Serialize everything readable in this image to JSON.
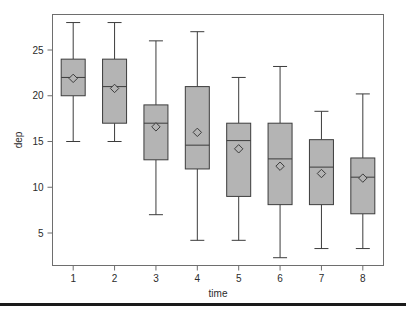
{
  "figure": {
    "background_color": "#ffffff",
    "frame_color": "#6e6e6e",
    "box_fill_color": "#b4b4b4",
    "box_line_color": "#3c3c3c",
    "whisker_color": "#3c3c3c",
    "footer_rule_color": "#1a1a1a"
  },
  "chart_data": {
    "type": "box",
    "title": "",
    "subtitle": "",
    "xlabel": "time",
    "ylabel": "dep",
    "xlim": [
      0.5,
      8.5
    ],
    "ylim": [
      1.2,
      28.6
    ],
    "grid": false,
    "legend": null,
    "categories": [
      "1",
      "2",
      "3",
      "4",
      "5",
      "6",
      "7",
      "8"
    ],
    "xticks": [
      "1",
      "2",
      "3",
      "4",
      "5",
      "6",
      "7",
      "8"
    ],
    "yticks": [
      5,
      10,
      15,
      20,
      25
    ],
    "ytick_labels": [
      "5",
      "10",
      "15",
      "20",
      "25"
    ],
    "mean_marker": "diamond",
    "boxes": [
      {
        "category": "1",
        "whisker_low": 15.0,
        "q1": 20.0,
        "median": 22.0,
        "q3": 24.0,
        "whisker_high": 28.0,
        "mean": 21.9
      },
      {
        "category": "2",
        "whisker_low": 15.0,
        "q1": 17.0,
        "median": 21.0,
        "q3": 24.0,
        "whisker_high": 28.0,
        "mean": 20.8
      },
      {
        "category": "3",
        "whisker_low": 7.0,
        "q1": 13.0,
        "median": 17.0,
        "q3": 19.0,
        "whisker_high": 26.0,
        "mean": 16.6
      },
      {
        "category": "4",
        "whisker_low": 4.2,
        "q1": 12.0,
        "median": 14.6,
        "q3": 21.0,
        "whisker_high": 27.0,
        "mean": 16.0
      },
      {
        "category": "5",
        "whisker_low": 4.2,
        "q1": 9.0,
        "median": 15.1,
        "q3": 17.0,
        "whisker_high": 22.0,
        "mean": 14.2
      },
      {
        "category": "6",
        "whisker_low": 2.3,
        "q1": 8.1,
        "median": 13.1,
        "q3": 17.0,
        "whisker_high": 23.2,
        "mean": 12.3
      },
      {
        "category": "7",
        "whisker_low": 3.3,
        "q1": 8.1,
        "median": 12.2,
        "q3": 15.2,
        "whisker_high": 18.3,
        "mean": 11.5
      },
      {
        "category": "8",
        "whisker_low": 3.3,
        "q1": 7.1,
        "median": 11.1,
        "q3": 13.2,
        "whisker_high": 20.2,
        "mean": 11.0
      }
    ]
  }
}
